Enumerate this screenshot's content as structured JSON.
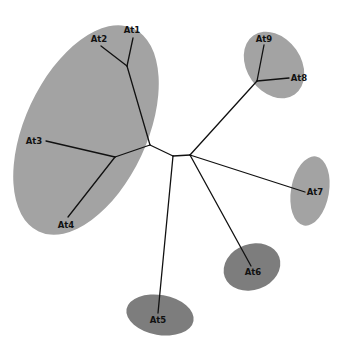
{
  "diagram": {
    "type": "unrooted phylogenetic tree",
    "colors": {
      "background": "#ffffff",
      "branch": "#111111",
      "clade_light": "#a3a3a3",
      "clade_dark": "#7d7d7d",
      "label": "#111111"
    },
    "clades": [
      {
        "id": "clade-at1-at4",
        "members": [
          "At1",
          "At2",
          "At3",
          "At4"
        ],
        "shade": "light",
        "cx": 86,
        "cy": 130,
        "rx": 61,
        "ry": 112,
        "rotate": 25
      },
      {
        "id": "clade-at8-at9",
        "members": [
          "At8",
          "At9"
        ],
        "shade": "light",
        "cx": 274,
        "cy": 65,
        "rx": 27,
        "ry": 36,
        "rotate": -35
      },
      {
        "id": "clade-at7",
        "members": [
          "At7"
        ],
        "shade": "light",
        "cx": 310,
        "cy": 191,
        "rx": 19,
        "ry": 35,
        "rotate": 10
      },
      {
        "id": "clade-at6",
        "members": [
          "At6"
        ],
        "shade": "dark",
        "cx": 252,
        "cy": 267,
        "rx": 29,
        "ry": 23,
        "rotate": -20
      },
      {
        "id": "clade-at5",
        "members": [
          "At5"
        ],
        "shade": "dark",
        "cx": 160,
        "cy": 315,
        "rx": 34,
        "ry": 20,
        "rotate": 10
      }
    ],
    "nodes": {
      "n_center_left": [
        173,
        156
      ],
      "n_center_right": [
        190,
        155
      ],
      "n_left_root": [
        150,
        145
      ],
      "n_at1_at2": [
        127,
        66
      ],
      "n_at3_at4": [
        115,
        157
      ],
      "n_at8_at9": [
        257,
        81
      ]
    },
    "branches": [
      {
        "from": [
          150,
          145
        ],
        "to": [
          173,
          156
        ]
      },
      {
        "from": [
          173,
          156
        ],
        "to": [
          190,
          155
        ]
      },
      {
        "from": [
          150,
          145
        ],
        "to": [
          127,
          66
        ]
      },
      {
        "from": [
          127,
          66
        ],
        "to": [
          133,
          38
        ]
      },
      {
        "from": [
          127,
          66
        ],
        "to": [
          101,
          46
        ]
      },
      {
        "from": [
          150,
          145
        ],
        "to": [
          115,
          157
        ]
      },
      {
        "from": [
          115,
          157
        ],
        "to": [
          46,
          141
        ]
      },
      {
        "from": [
          115,
          157
        ],
        "to": [
          68,
          217
        ]
      },
      {
        "from": [
          173,
          156
        ],
        "to": [
          158,
          313
        ]
      },
      {
        "from": [
          190,
          155
        ],
        "to": [
          257,
          81
        ]
      },
      {
        "from": [
          257,
          81
        ],
        "to": [
          264,
          45
        ]
      },
      {
        "from": [
          257,
          81
        ],
        "to": [
          289,
          78
        ]
      },
      {
        "from": [
          190,
          155
        ],
        "to": [
          305,
          192
        ]
      },
      {
        "from": [
          190,
          155
        ],
        "to": [
          251,
          266
        ]
      }
    ],
    "taxa": [
      {
        "label": "At1",
        "x": 132,
        "y": 33,
        "anchor": "middle"
      },
      {
        "label": "At2",
        "x": 99,
        "y": 42,
        "anchor": "middle"
      },
      {
        "label": "At3",
        "x": 34,
        "y": 144,
        "anchor": "middle"
      },
      {
        "label": "At4",
        "x": 66,
        "y": 228,
        "anchor": "middle"
      },
      {
        "label": "At5",
        "x": 158,
        "y": 323,
        "anchor": "middle"
      },
      {
        "label": "At6",
        "x": 253,
        "y": 275,
        "anchor": "middle"
      },
      {
        "label": "At7",
        "x": 315,
        "y": 195,
        "anchor": "middle"
      },
      {
        "label": "At8",
        "x": 299,
        "y": 81,
        "anchor": "middle"
      },
      {
        "label": "At9",
        "x": 264,
        "y": 42,
        "anchor": "middle"
      }
    ]
  }
}
